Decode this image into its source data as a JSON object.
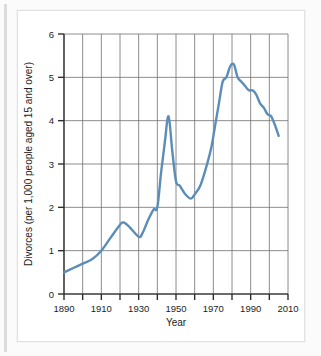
{
  "chart_data": {
    "type": "line",
    "title": "",
    "xlabel": "Year",
    "ylabel": "Divorces (per 1,000 people aged 15 and over)",
    "xlim": [
      1890,
      2010
    ],
    "ylim": [
      0,
      6
    ],
    "x_major_ticks": [
      1890,
      1910,
      1930,
      1950,
      1970,
      1990,
      2010
    ],
    "x_minor_ticks": [
      1900,
      1920,
      1940,
      1960,
      1980,
      2000
    ],
    "x_tick_labels": [
      "1890",
      "1910",
      "1930",
      "1950",
      "1970",
      "1990",
      "2010"
    ],
    "y_ticks": [
      0,
      1,
      2,
      3,
      4,
      5,
      6
    ],
    "y_tick_labels": [
      "0",
      "1",
      "2",
      "3",
      "4",
      "5",
      "6"
    ],
    "grid": "vertical every 10 years, horizontal every 1 unit",
    "legend": "none",
    "line_color": "#5b8db8",
    "grid_color": "#6e6e6e",
    "axis_color": "#3a3a3a",
    "series": [
      {
        "name": "Divorce rate",
        "x": [
          1890,
          1895,
          1900,
          1905,
          1910,
          1915,
          1920,
          1922,
          1925,
          1930,
          1932,
          1935,
          1938,
          1940,
          1942,
          1944,
          1946,
          1948,
          1950,
          1952,
          1955,
          1958,
          1960,
          1963,
          1966,
          1969,
          1971,
          1973,
          1975,
          1977,
          1979,
          1981,
          1983,
          1985,
          1987,
          1989,
          1991,
          1993,
          1995,
          1997,
          1999,
          2001,
          2003,
          2005
        ],
        "y": [
          0.5,
          0.6,
          0.7,
          0.8,
          1.0,
          1.3,
          1.6,
          1.65,
          1.55,
          1.32,
          1.4,
          1.7,
          1.95,
          2.0,
          2.8,
          3.5,
          4.1,
          3.3,
          2.6,
          2.5,
          2.3,
          2.2,
          2.3,
          2.5,
          2.9,
          3.4,
          3.9,
          4.4,
          4.9,
          5.0,
          5.25,
          5.3,
          5.0,
          4.9,
          4.8,
          4.7,
          4.7,
          4.6,
          4.4,
          4.3,
          4.15,
          4.1,
          3.9,
          3.65
        ]
      }
    ],
    "annotations": []
  },
  "figure": {
    "x_axis_title": "Year",
    "y_axis_title": "Divorces (per 1,000 people aged 15 and over)"
  }
}
